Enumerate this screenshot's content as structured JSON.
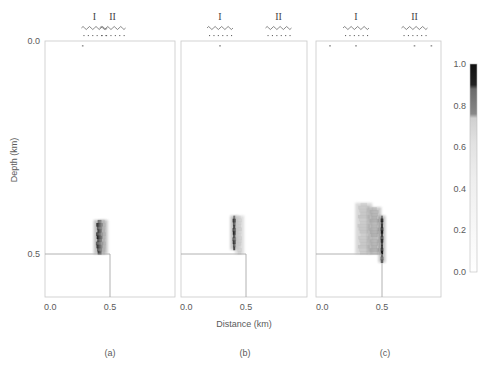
{
  "chart_data": {
    "type": "heatmap",
    "title": "",
    "xlabel": "Distance (km)",
    "ylabel": "Depth (km)",
    "y_ticks": [
      "0.0",
      "0.5"
    ],
    "x_ticks": [
      "0.0",
      "0.5"
    ],
    "xlim": [
      0.0,
      1.0
    ],
    "ylim": [
      0.0,
      0.6
    ],
    "colorbar": {
      "min": 0.0,
      "max": 1.0,
      "ticks": [
        "0.0",
        "0.2",
        "0.4",
        "0.6",
        "0.8",
        "1.0"
      ],
      "colormap": "grayscale (white = 0, black = 1)"
    },
    "panels": [
      {
        "label": "(a)",
        "markers": [
          {
            "name": "I",
            "x": 0.38
          },
          {
            "name": "II",
            "x": 0.52
          }
        ],
        "surface_points": [
          0.29
        ],
        "structure_outline": {
          "corner_x": 0.5,
          "corner_depth": 0.5
        },
        "anomalies": [
          {
            "x_center": 0.42,
            "x_halfwidth": 0.03,
            "depth_top": 0.42,
            "depth_bottom": 0.5,
            "peak": 1.0
          },
          {
            "x_center": 0.45,
            "x_halfwidth": 0.02,
            "depth_top": 0.42,
            "depth_bottom": 0.5,
            "peak": 0.35
          }
        ]
      },
      {
        "label": "(b)",
        "markers": [
          {
            "name": "I",
            "x": 0.3
          },
          {
            "name": "II",
            "x": 0.75
          }
        ],
        "surface_points": [
          0.3
        ],
        "structure_outline": {
          "corner_x": 0.5,
          "corner_depth": 0.5
        },
        "anomalies": [
          {
            "x_center": 0.41,
            "x_halfwidth": 0.015,
            "depth_top": 0.41,
            "depth_bottom": 0.49,
            "peak": 1.0
          },
          {
            "x_center": 0.45,
            "x_halfwidth": 0.02,
            "depth_top": 0.41,
            "depth_bottom": 0.5,
            "peak": 0.25
          }
        ]
      },
      {
        "label": "(c)",
        "markers": [
          {
            "name": "I",
            "x": 0.3
          },
          {
            "name": "II",
            "x": 0.75
          }
        ],
        "surface_points": [
          0.1,
          0.3,
          0.75,
          0.88
        ],
        "structure_outline": {
          "corner_x": 0.5,
          "corner_depth": 0.5
        },
        "anomalies": [
          {
            "x_center": 0.36,
            "x_halfwidth": 0.05,
            "depth_top": 0.38,
            "depth_bottom": 0.5,
            "peak": 0.3
          },
          {
            "x_center": 0.44,
            "x_halfwidth": 0.04,
            "depth_top": 0.39,
            "depth_bottom": 0.5,
            "peak": 0.4
          },
          {
            "x_center": 0.5,
            "x_halfwidth": 0.012,
            "depth_top": 0.41,
            "depth_bottom": 0.52,
            "peak": 1.0
          }
        ]
      }
    ]
  }
}
